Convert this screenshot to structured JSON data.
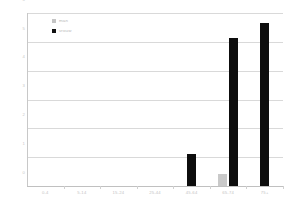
{
  "chart_data": {
    "type": "bar",
    "title": "",
    "subtitle": "",
    "xlabel": "",
    "ylabel": "",
    "categories": [
      "0-4",
      "5-14",
      "15-24",
      "25-44",
      "45-64",
      "65-74",
      "75+"
    ],
    "series": [
      {
        "name": "man",
        "color": "#c9c9c9",
        "values": [
          0,
          0,
          0,
          0,
          0,
          0.4,
          0
        ]
      },
      {
        "name": "vrouw",
        "color": "#0d0d0d",
        "values": [
          0,
          0,
          0,
          0,
          1.1,
          5.15,
          5.65
        ]
      }
    ],
    "ylim": [
      0,
      6
    ],
    "yticks": [
      0,
      1,
      2,
      3,
      4,
      5,
      6
    ],
    "ytick_labels": [
      "0",
      "1",
      "2",
      "3",
      "4",
      "5",
      "6"
    ],
    "grid": true,
    "legend_position": "top-left",
    "annotations": []
  },
  "legend": {
    "entries": [
      {
        "label": "man",
        "swatch": "gray-square-icon"
      },
      {
        "label": "vrouw",
        "swatch": "black-square-icon"
      }
    ]
  },
  "axes": {
    "y_axis_name": "y-axis",
    "x_axis_name": "x-axis"
  },
  "colors": {
    "series_man": "#c9c9c9",
    "series_vrouw": "#0d0d0d",
    "grid": "#d9d9d9",
    "tick_text": "#c4c4c4",
    "background": "#ffffff"
  }
}
